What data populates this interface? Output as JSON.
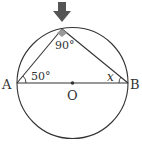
{
  "diagram": {
    "type": "circle-geometry",
    "labels": {
      "point_a": "A",
      "point_b": "B",
      "center": "O",
      "angle_a": "50°",
      "angle_top": "90°",
      "angle_b": "x"
    },
    "colors": {
      "stroke": "#333333",
      "marker": "#888888",
      "arrow": "#555555"
    }
  }
}
